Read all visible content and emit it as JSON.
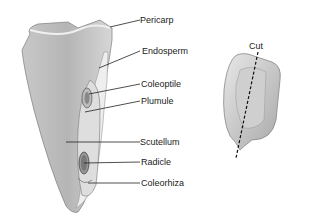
{
  "diagram": {
    "labels": [
      {
        "id": "pericarp",
        "text": "Pericarp",
        "x": 170,
        "y": 15
      },
      {
        "id": "endosperm",
        "text": "Endosperm",
        "x": 172,
        "y": 44
      },
      {
        "id": "coleoptile",
        "text": "Coleoptile",
        "x": 170,
        "y": 77
      },
      {
        "id": "plumule",
        "text": "Plumule",
        "x": 170,
        "y": 94
      },
      {
        "id": "scutellum",
        "text": "Scutellum",
        "x": 167,
        "y": 137
      },
      {
        "id": "radicle",
        "text": "Radicle",
        "x": 170,
        "y": 157
      },
      {
        "id": "coleorhiza",
        "text": "Coleorhiza",
        "x": 170,
        "y": 178
      }
    ],
    "cut_label": {
      "text": "Cut",
      "x": 249,
      "y": 41
    }
  }
}
